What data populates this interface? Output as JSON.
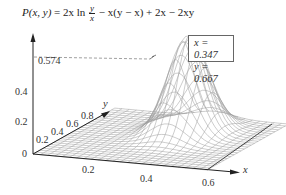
{
  "title": {
    "lhs": "P(x, y)",
    "eq": "= 2x ln",
    "frac_num": "y",
    "frac_den": "x",
    "rhs": "− x(y − x) + 2x − 2xy"
  },
  "infobox": {
    "x_line": "x = 0.347",
    "y_line": "y = 0.667"
  },
  "z_axis": {
    "ticks": [
      "0",
      "0.2",
      "0.4"
    ],
    "max_label": "0.574"
  },
  "x_axis": {
    "label": "x",
    "ticks": [
      "0.2",
      "0.4",
      "0.6"
    ]
  },
  "y_axis": {
    "label": "y",
    "ticks": [
      "0.2",
      "0.4",
      "0.6",
      "0.8"
    ]
  },
  "chart_data": {
    "type": "surface",
    "xlabel": "x",
    "ylabel": "y",
    "zlabel": "P",
    "x_ticks": [
      0.2,
      0.4,
      0.6
    ],
    "y_ticks": [
      0.2,
      0.4,
      0.6,
      0.8
    ],
    "z_ticks": [
      0,
      0.2,
      0.4
    ],
    "xlim": [
      0,
      0.6
    ],
    "ylim": [
      0,
      1
    ],
    "zlim": [
      0,
      0.574
    ],
    "maximum": {
      "x": 0.347,
      "y": 0.667,
      "z": 0.574
    },
    "annotations": [
      "x = 0.347",
      "y = 0.667",
      "0.574 (max value, dashed line to peak)"
    ],
    "grid": false,
    "legend": "none"
  },
  "colors": {
    "mesh": "#8a8a8a",
    "axis": "#222222",
    "text": "#333333",
    "dashed": "#777777"
  }
}
